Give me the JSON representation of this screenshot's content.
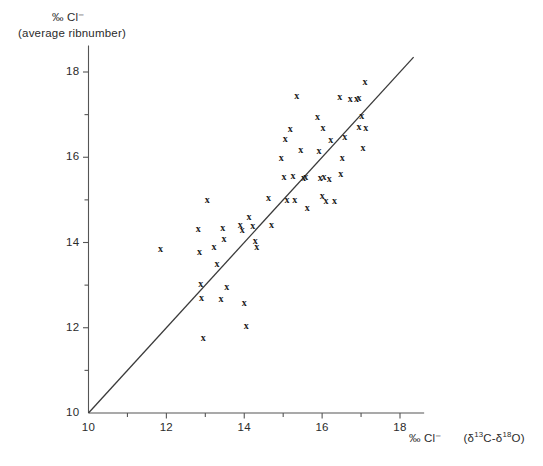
{
  "chart_data": {
    "type": "scatter",
    "title": "",
    "ylabel": "‰ Cl⁻",
    "ylabel_sub": "(average ribnumber)",
    "xlabel_units": "‰ Cl⁻",
    "xlabel_expr": "(δ¹³C-δ¹⁸O)",
    "xlim": [
      10,
      18.5
    ],
    "ylim": [
      10,
      18.5
    ],
    "xticks_major": [
      10,
      12,
      14,
      16,
      18
    ],
    "yticks_major": [
      10,
      12,
      14,
      16,
      18
    ],
    "xticks_minor": [
      11,
      13,
      15,
      17
    ],
    "yticks_minor": [
      11,
      13,
      15,
      17
    ],
    "xtick_labels": [
      "10",
      "12",
      "14",
      "16",
      "18"
    ],
    "ytick_labels": [
      "10",
      "12",
      "14",
      "16",
      "18"
    ],
    "grid": false,
    "legend": "none",
    "marker_symbol": "x",
    "line": {
      "name": "1:1 reference line",
      "x": [
        10.0,
        18.35
      ],
      "y": [
        10.0,
        18.35
      ],
      "color": "#3a3a3a"
    },
    "points": [
      {
        "x": 11.85,
        "y": 13.87
      },
      {
        "x": 12.82,
        "y": 14.33
      },
      {
        "x": 12.85,
        "y": 13.8
      },
      {
        "x": 12.88,
        "y": 13.03
      },
      {
        "x": 12.9,
        "y": 12.72
      },
      {
        "x": 12.95,
        "y": 11.77
      },
      {
        "x": 13.05,
        "y": 15.0
      },
      {
        "x": 13.22,
        "y": 13.92
      },
      {
        "x": 13.3,
        "y": 13.52
      },
      {
        "x": 13.4,
        "y": 12.68
      },
      {
        "x": 13.45,
        "y": 14.35
      },
      {
        "x": 13.48,
        "y": 14.1
      },
      {
        "x": 13.55,
        "y": 12.98
      },
      {
        "x": 13.9,
        "y": 14.42
      },
      {
        "x": 13.95,
        "y": 14.3
      },
      {
        "x": 14.0,
        "y": 12.6
      },
      {
        "x": 14.05,
        "y": 12.05
      },
      {
        "x": 14.12,
        "y": 14.62
      },
      {
        "x": 14.22,
        "y": 14.4
      },
      {
        "x": 14.28,
        "y": 14.05
      },
      {
        "x": 14.32,
        "y": 13.92
      },
      {
        "x": 14.62,
        "y": 15.05
      },
      {
        "x": 14.7,
        "y": 14.42
      },
      {
        "x": 14.95,
        "y": 16.0
      },
      {
        "x": 15.02,
        "y": 15.55
      },
      {
        "x": 15.05,
        "y": 16.45
      },
      {
        "x": 15.1,
        "y": 15.0
      },
      {
        "x": 15.18,
        "y": 16.68
      },
      {
        "x": 15.25,
        "y": 15.58
      },
      {
        "x": 15.3,
        "y": 15.0
      },
      {
        "x": 15.35,
        "y": 17.45
      },
      {
        "x": 15.45,
        "y": 16.18
      },
      {
        "x": 15.52,
        "y": 15.52
      },
      {
        "x": 15.58,
        "y": 15.55
      },
      {
        "x": 15.62,
        "y": 14.82
      },
      {
        "x": 15.88,
        "y": 16.95
      },
      {
        "x": 15.92,
        "y": 16.15
      },
      {
        "x": 15.95,
        "y": 15.52
      },
      {
        "x": 16.0,
        "y": 15.1
      },
      {
        "x": 16.02,
        "y": 16.7
      },
      {
        "x": 16.05,
        "y": 15.55
      },
      {
        "x": 16.1,
        "y": 14.98
      },
      {
        "x": 16.18,
        "y": 15.5
      },
      {
        "x": 16.22,
        "y": 16.42
      },
      {
        "x": 16.32,
        "y": 14.98
      },
      {
        "x": 16.45,
        "y": 17.42
      },
      {
        "x": 16.48,
        "y": 15.62
      },
      {
        "x": 16.52,
        "y": 16.0
      },
      {
        "x": 16.58,
        "y": 16.48
      },
      {
        "x": 16.72,
        "y": 17.38
      },
      {
        "x": 16.88,
        "y": 17.38
      },
      {
        "x": 16.95,
        "y": 17.4
      },
      {
        "x": 16.95,
        "y": 16.72
      },
      {
        "x": 17.02,
        "y": 16.98
      },
      {
        "x": 17.05,
        "y": 16.22
      },
      {
        "x": 17.1,
        "y": 17.78
      },
      {
        "x": 17.12,
        "y": 16.7
      }
    ]
  },
  "axes": {
    "y_axis_name": "y-axis",
    "x_axis_name": "x-axis"
  }
}
